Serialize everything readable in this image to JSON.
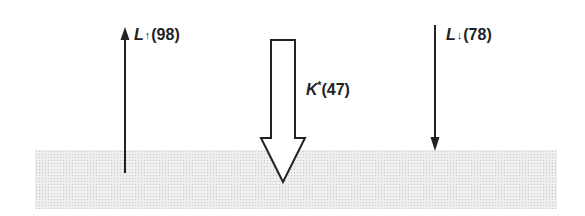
{
  "diagram": {
    "type": "surface-energy-balance-fluxes",
    "colors": {
      "ink": "#222222",
      "ground_fill": "#eeeeee",
      "ground_dots": "#c8c8c8",
      "background": "#ffffff"
    },
    "fluxes": [
      {
        "id": "longwave-up",
        "symbol": "L",
        "direction_glyph": "↑",
        "value_text": "(98)",
        "value": 98,
        "direction": "up",
        "style": "line-arrow"
      },
      {
        "id": "net-shortwave",
        "symbol": "K",
        "superscript": "*",
        "value_text": "(47)",
        "value": 47,
        "direction": "down",
        "style": "hollow-block-arrow"
      },
      {
        "id": "longwave-down",
        "symbol": "L",
        "direction_glyph": "↓",
        "value_text": "(78)",
        "value": 78,
        "direction": "down",
        "style": "line-arrow"
      }
    ],
    "surface": {
      "label": "",
      "pattern": "stippled"
    }
  }
}
